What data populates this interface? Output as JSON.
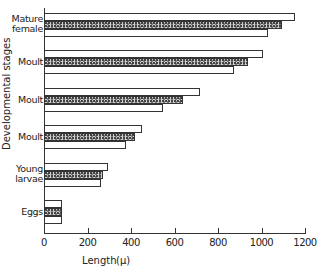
{
  "chart_data": {
    "type": "bar",
    "orientation": "horizontal",
    "title": "",
    "xlabel": "Length",
    "xunit": "(μ)",
    "ylabel": "Developmental stages",
    "xlim": [
      0,
      1200
    ],
    "xticks": [
      0,
      200,
      400,
      600,
      800,
      1000,
      1200
    ],
    "xtick_labels": [
      "0",
      "200",
      "400",
      "600",
      "800",
      "1000",
      "1200"
    ],
    "grid": false,
    "legend": null,
    "categories": [
      "Mature female",
      "Moult",
      "Moult",
      "Moult",
      "Young larvae",
      "Eggs"
    ],
    "category_labels": [
      "Mature\nfemale",
      "Moult",
      "Moult",
      "Moult",
      "Young\nlarvae",
      "Eggs"
    ],
    "series": [
      {
        "name": "upper (open)",
        "pattern": "open",
        "values": [
          1155,
          1005,
          715,
          450,
          295,
          85
        ]
      },
      {
        "name": "middle (stippled)",
        "pattern": "stippled",
        "values": [
          1095,
          940,
          640,
          420,
          272,
          85
        ]
      },
      {
        "name": "lower (open)",
        "pattern": "open",
        "values": [
          1030,
          875,
          545,
          378,
          262,
          85
        ]
      }
    ]
  }
}
